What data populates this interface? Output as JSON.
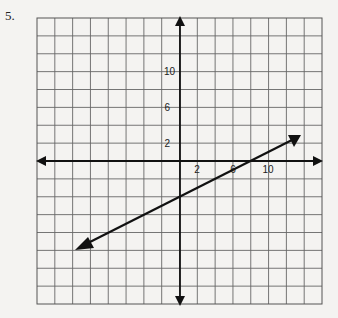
{
  "problem_number": "5.",
  "chart_data": {
    "type": "line",
    "title": "",
    "xlabel": "",
    "ylabel": "",
    "grid": true,
    "grid_units_per_cell": 2,
    "xlim": [
      -16,
      16
    ],
    "ylim": [
      -16,
      16
    ],
    "x_tick_labels": [
      "2",
      "6",
      "10"
    ],
    "x_tick_values": [
      2,
      6,
      10
    ],
    "y_tick_labels": [
      "2",
      "6",
      "10"
    ],
    "y_tick_values": [
      2,
      6,
      10
    ],
    "series": [
      {
        "name": "line",
        "arrows": "both",
        "x": [
          -12,
          13.5
        ],
        "y": [
          -10,
          2.7
        ],
        "approx_slope": 0.5,
        "approx_y_intercept": -4
      }
    ]
  },
  "labels": {
    "x2": "2",
    "x6": "6",
    "x10": "10",
    "y2": "2",
    "y6": "6",
    "y10": "10"
  }
}
